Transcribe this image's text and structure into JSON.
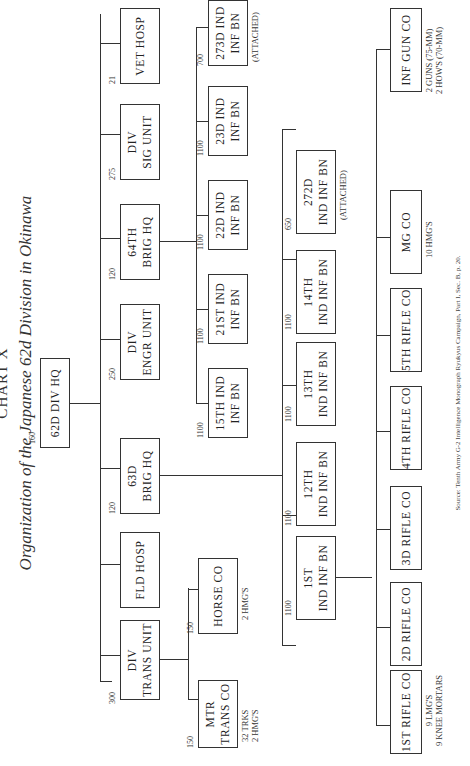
{
  "header": {
    "title_line1": "CHART X",
    "title_line2": "Organization of the Japanese 62d Division in Okinawa"
  },
  "hq": {
    "label": [
      "62D DIV HQ"
    ],
    "strength": "160"
  },
  "level1": [
    {
      "label": [
        "DIV",
        "TRANS UNIT"
      ],
      "strength": "300"
    },
    {
      "label": [
        "FLD HOSP"
      ],
      "strength": ""
    },
    {
      "label": [
        "63D",
        "BRIG HQ"
      ],
      "strength": "120"
    },
    {
      "label": [
        "DIV",
        "ENGR UNIT"
      ],
      "strength": "250"
    },
    {
      "label": [
        "64TH",
        "BRIG HQ"
      ],
      "strength": "120"
    },
    {
      "label": [
        "DIV",
        "SIG UNIT"
      ],
      "strength": "275"
    },
    {
      "label": [
        "VET HOSP"
      ],
      "strength": "21"
    }
  ],
  "trans_units": [
    {
      "label": [
        "MTR",
        "TRANS CO"
      ],
      "strength": "150",
      "note": [
        "32 TRKS",
        "2 HMG'S"
      ]
    },
    {
      "label": [
        "HORSE CO"
      ],
      "strength": "150",
      "note": [
        "2 HMG'S"
      ]
    }
  ],
  "brig64_units": [
    {
      "label": [
        "15TH IND",
        "INF BN"
      ],
      "strength": "1100",
      "note": []
    },
    {
      "label": [
        "21ST IND",
        "INF BN"
      ],
      "strength": "1100",
      "note": []
    },
    {
      "label": [
        "22D IND",
        "INF BN"
      ],
      "strength": "1100",
      "note": []
    },
    {
      "label": [
        "23D IND",
        "INF BN"
      ],
      "strength": "1100",
      "note": []
    },
    {
      "label": [
        "273D IND",
        "INF BN"
      ],
      "strength": "700",
      "note": [
        "(ATTACHED)"
      ]
    }
  ],
  "brig63_units": [
    {
      "label": [
        "1ST",
        "IND INF BN"
      ],
      "strength": "1100",
      "note": []
    },
    {
      "label": [
        "12TH",
        "IND INF BN"
      ],
      "strength": "1100",
      "note": []
    },
    {
      "label": [
        "13TH",
        "IND INF BN"
      ],
      "strength": "1100",
      "note": []
    },
    {
      "label": [
        "14TH",
        "IND INF BN"
      ],
      "strength": "1100",
      "note": []
    },
    {
      "label": [
        "272D",
        "IND INF BN"
      ],
      "strength": "650",
      "note": [
        "(ATTACHED)"
      ]
    }
  ],
  "bn_companies": [
    {
      "label": [
        "1ST RIFLE CO"
      ],
      "note": [
        "9 LMG'S",
        "9 KNEE MORTARS"
      ]
    },
    {
      "label": [
        "2D RIFLE CO"
      ],
      "note": []
    },
    {
      "label": [
        "3D RIFLE CO"
      ],
      "note": []
    },
    {
      "label": [
        "4TH RIFLE CO"
      ],
      "note": []
    },
    {
      "label": [
        "5TH RIFLE CO"
      ],
      "note": []
    },
    {
      "label": [
        "MG CO"
      ],
      "note": [
        "10 HMG'S"
      ]
    },
    {
      "label": [
        "INF GUN CO"
      ],
      "note": [
        "2 GUNS (75-MM)",
        "2 HOW'S (70-MM)"
      ]
    }
  ],
  "footer": {
    "source": "Source: Tenth Army G-2 Intelligence Monograph Ryukyus Campaign, Part I, Sec. B, p. 20."
  }
}
